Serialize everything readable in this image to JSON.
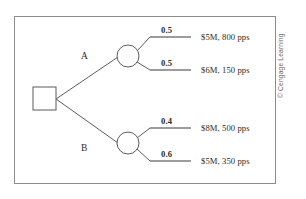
{
  "figure": {
    "credit": "© Cengage Learning",
    "border_color": "#8d8d8d",
    "line_color": "#4a4a4a",
    "text_color": "#2b2b2b"
  },
  "decision_node": {
    "shape": "square",
    "label": ""
  },
  "branches": [
    {
      "id": "A",
      "label": "A",
      "node_shape": "circle",
      "outcomes": [
        {
          "probability": "0.5",
          "payoff": "$5M, 800 pps"
        },
        {
          "probability": "0.5",
          "payoff": "$6M, 150 pps"
        }
      ]
    },
    {
      "id": "B",
      "label": "B",
      "node_shape": "circle",
      "outcomes": [
        {
          "probability": "0.4",
          "payoff": "$8M, 500 pps"
        },
        {
          "probability": "0.6",
          "payoff": "$5M, 350 pps"
        }
      ]
    }
  ]
}
